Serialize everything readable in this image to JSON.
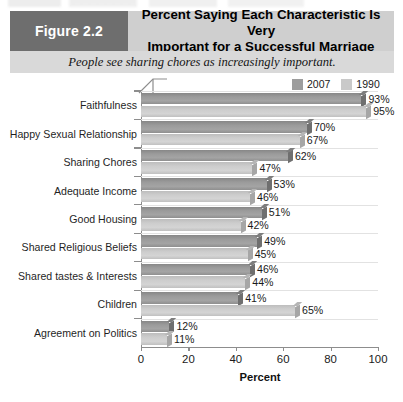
{
  "figure": {
    "badge_label": "Figure 2.2",
    "title": "Percent Saying Each Characteristic Is Very Important for a Successful Marriage",
    "title_line1": "Percent Saying Each Characteristic Is Very",
    "title_line2": "Important for a Successful Marriage",
    "subtitle": "People see sharing chores as increasingly important.",
    "badge_bg": "#6e6e6e",
    "header_bg": "#cfcfcf",
    "subtitle_bg": "#d9d9d9"
  },
  "legend": {
    "position": "top-right",
    "entries": [
      {
        "label": "2007",
        "color": "#9d9d9d"
      },
      {
        "label": "1990",
        "color": "#c9c9c9"
      }
    ]
  },
  "chart_data": {
    "type": "bar",
    "orientation": "horizontal",
    "title": "Percent Saying Each Characteristic Is Very Important for a Successful Marriage",
    "subtitle": "People see sharing chores as increasingly important.",
    "xlabel": "Percent",
    "ylabel": "",
    "xlim": [
      0,
      100
    ],
    "xticks": [
      0,
      20,
      40,
      60,
      80,
      100
    ],
    "xticklabels": [
      "0",
      "20",
      "40",
      "60",
      "80",
      "100"
    ],
    "grid": true,
    "legend_position": "top-right",
    "categories": [
      "Faithfulness",
      "Happy Sexual Relationship",
      "Sharing Chores",
      "Adequate Income",
      "Good Housing",
      "Shared Religious Beliefs",
      "Shared tastes & Interests",
      "Children",
      "Agreement on Politics"
    ],
    "series": [
      {
        "name": "2007",
        "color": "#9d9d9d",
        "values": [
          93,
          70,
          62,
          53,
          51,
          49,
          46,
          41,
          12
        ],
        "labels": [
          "93%",
          "70%",
          "62%",
          "53%",
          "51%",
          "49%",
          "46%",
          "41%",
          "12%"
        ]
      },
      {
        "name": "1990",
        "color": "#c9c9c9",
        "values": [
          95,
          67,
          47,
          46,
          42,
          45,
          44,
          65,
          11
        ],
        "labels": [
          "95%",
          "67%",
          "47%",
          "46%",
          "42%",
          "45%",
          "44%",
          "65%",
          "11%"
        ]
      }
    ]
  }
}
